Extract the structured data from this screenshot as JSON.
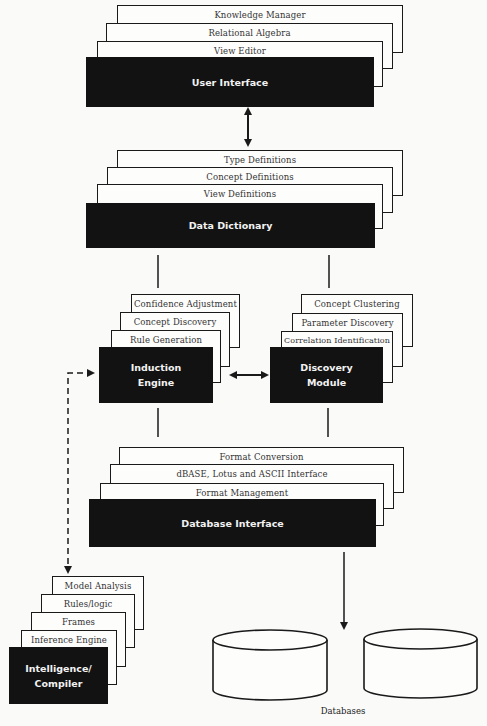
{
  "stacks": {
    "user_interface": {
      "title": "User Interface",
      "layers": [
        "Knowledge Manager",
        "Relational Algebra",
        "View Editor"
      ]
    },
    "data_dictionary": {
      "title": "Data Dictionary",
      "layers": [
        "Type Definitions",
        "Concept Definitions",
        "View Definitions"
      ]
    },
    "induction_engine": {
      "title_lines": [
        "Induction",
        "Engine"
      ],
      "layers": [
        "Confidence Adjustment",
        "Concept Discovery",
        "Rule Generation"
      ]
    },
    "discovery_module": {
      "title_lines": [
        "Discovery",
        "Module"
      ],
      "layers": [
        "Concept Clustering",
        "Parameter Discovery",
        "Correlation Identification"
      ]
    },
    "database_interface": {
      "title": "Database Interface",
      "layers": [
        "Format Conversion",
        "dBASE, Lotus and ASCII Interface",
        "Format Management"
      ]
    },
    "intelligence_compiler": {
      "title_lines": [
        "Intelligence/",
        "Compiler"
      ],
      "layers": [
        "Model Analysis",
        "Rules/logic",
        "Frames",
        "Inference Engine"
      ]
    }
  },
  "databases": {
    "label": "Databases",
    "count": 2
  },
  "colors": {
    "background": "#fafaf9",
    "core_fill": "#121212",
    "layer_fill": "#fdfdfc",
    "line": "#1a1a1a"
  }
}
